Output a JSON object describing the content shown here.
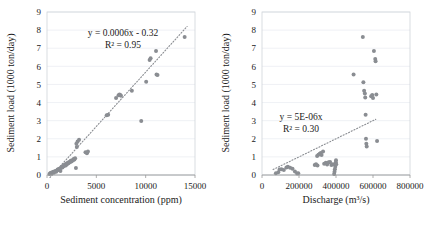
{
  "chart_data": [
    {
      "id": "left",
      "type": "scatter",
      "title": "",
      "xlabel": "Sediment concentration (ppm)",
      "ylabel": "Sediment load (1000 ton/day)",
      "xlim": [
        0,
        15000
      ],
      "ylim": [
        0,
        9
      ],
      "xticks": [
        0,
        5000,
        10000,
        15000
      ],
      "yticks": [
        0,
        1,
        2,
        3,
        4,
        5,
        6,
        7,
        8,
        9
      ],
      "grid": true,
      "legend": "none",
      "marker_color": "#8a8d92",
      "annotations": {
        "equation": "y = 0.0006x - 0.32",
        "r2": "R² = 0.95"
      },
      "trendline": {
        "slope": 0.0006,
        "intercept": -0.32,
        "x_start": 300,
        "x_end": 14200,
        "style": "dotted"
      },
      "points": [
        [
          250,
          0.05
        ],
        [
          330,
          0.1
        ],
        [
          400,
          0.12
        ],
        [
          470,
          0.08
        ],
        [
          560,
          0.15
        ],
        [
          640,
          0.18
        ],
        [
          700,
          0.12
        ],
        [
          780,
          0.2
        ],
        [
          860,
          0.22
        ],
        [
          930,
          0.18
        ],
        [
          1000,
          0.25
        ],
        [
          1080,
          0.3
        ],
        [
          1150,
          0.28
        ],
        [
          1220,
          0.35
        ],
        [
          1300,
          0.33
        ],
        [
          1360,
          0.22
        ],
        [
          1420,
          0.4
        ],
        [
          1500,
          0.45
        ],
        [
          1560,
          0.42
        ],
        [
          1630,
          0.5
        ],
        [
          1700,
          0.48
        ],
        [
          1760,
          0.55
        ],
        [
          1830,
          0.58
        ],
        [
          1900,
          0.52
        ],
        [
          1960,
          0.62
        ],
        [
          2030,
          0.6
        ],
        [
          2100,
          0.68
        ],
        [
          2180,
          0.65
        ],
        [
          2250,
          0.72
        ],
        [
          2320,
          0.7
        ],
        [
          2400,
          0.78
        ],
        [
          2470,
          0.75
        ],
        [
          2550,
          0.82
        ],
        [
          2620,
          0.8
        ],
        [
          2700,
          0.88
        ],
        [
          2780,
          0.85
        ],
        [
          2850,
          0.92
        ],
        [
          2930,
          0.38
        ],
        [
          2980,
          1.72
        ],
        [
          3020,
          1.55
        ],
        [
          3100,
          1.85
        ],
        [
          3250,
          1.95
        ],
        [
          3900,
          1.25
        ],
        [
          4050,
          1.2
        ],
        [
          4150,
          1.3
        ],
        [
          6050,
          3.3
        ],
        [
          6200,
          3.32
        ],
        [
          7000,
          4.25
        ],
        [
          7250,
          4.4
        ],
        [
          7350,
          4.45
        ],
        [
          7420,
          4.42
        ],
        [
          7500,
          4.38
        ],
        [
          8600,
          4.65
        ],
        [
          9550,
          2.98
        ],
        [
          10050,
          5.15
        ],
        [
          10400,
          6.35
        ],
        [
          10500,
          6.45
        ],
        [
          11050,
          6.85
        ],
        [
          11100,
          5.55
        ],
        [
          11200,
          5.52
        ],
        [
          13950,
          7.62
        ]
      ]
    },
    {
      "id": "right",
      "type": "scatter",
      "title": "",
      "xlabel": "Discharge (m³/s)",
      "ylabel": "Sediment load (1000 ton/day)",
      "xlim": [
        0,
        800000
      ],
      "ylim": [
        0,
        9
      ],
      "xticks": [
        0,
        200000,
        400000,
        600000,
        800000
      ],
      "yticks": [
        0,
        1,
        2,
        3,
        4,
        5,
        6,
        7,
        8,
        9
      ],
      "grid": true,
      "legend": "none",
      "marker_color": "#8a8d92",
      "annotations": {
        "equation": "y = 5E-06x",
        "r2": "R² = 0.30"
      },
      "trendline": {
        "slope": 5e-06,
        "intercept": 0.0,
        "x_start": 60000,
        "x_end": 615000,
        "style": "dotted"
      },
      "points": [
        [
          75000,
          0.1
        ],
        [
          88000,
          0.15
        ],
        [
          95000,
          0.3
        ],
        [
          105000,
          0.32
        ],
        [
          118000,
          0.28
        ],
        [
          132000,
          0.42
        ],
        [
          140000,
          0.45
        ],
        [
          152000,
          0.4
        ],
        [
          165000,
          0.35
        ],
        [
          178000,
          0.2
        ],
        [
          190000,
          0.08
        ],
        [
          196000,
          0.1
        ],
        [
          285000,
          0.55
        ],
        [
          292000,
          0.6
        ],
        [
          300000,
          0.52
        ],
        [
          298000,
          1.05
        ],
        [
          305000,
          1.12
        ],
        [
          312000,
          1.18
        ],
        [
          318000,
          1.22
        ],
        [
          322000,
          1.1
        ],
        [
          330000,
          1.3
        ],
        [
          336000,
          0.62
        ],
        [
          345000,
          0.68
        ],
        [
          352000,
          0.58
        ],
        [
          360000,
          0.7
        ],
        [
          368000,
          0.72
        ],
        [
          375000,
          0.55
        ],
        [
          382000,
          0.6
        ],
        [
          390000,
          0.05
        ],
        [
          392000,
          0.18
        ],
        [
          394000,
          0.32
        ],
        [
          396000,
          0.45
        ],
        [
          398000,
          0.58
        ],
        [
          399000,
          0.7
        ],
        [
          400000,
          0.82
        ],
        [
          401000,
          0.6
        ],
        [
          495000,
          5.55
        ],
        [
          545000,
          7.62
        ],
        [
          548000,
          5.12
        ],
        [
          552000,
          4.65
        ],
        [
          556000,
          4.5
        ],
        [
          558000,
          4.28
        ],
        [
          560000,
          3.32
        ],
        [
          562000,
          2.0
        ],
        [
          564000,
          1.72
        ],
        [
          566000,
          1.58
        ],
        [
          590000,
          4.35
        ],
        [
          596000,
          4.42
        ],
        [
          600000,
          4.25
        ],
        [
          605000,
          6.85
        ],
        [
          612000,
          6.4
        ],
        [
          614000,
          6.28
        ],
        [
          618000,
          4.45
        ],
        [
          622000,
          1.88
        ]
      ]
    }
  ]
}
